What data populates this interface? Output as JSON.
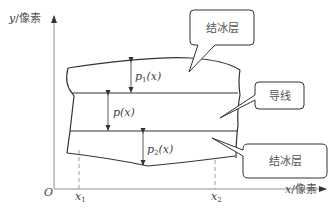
{
  "diagram": {
    "axes": {
      "y_label_var": "y",
      "y_label_unit": "/像素",
      "x_label_var": "x",
      "x_label_unit": "/像素",
      "origin": "O",
      "x1_var": "x",
      "x1_sub": "1",
      "x2_var": "x",
      "x2_sub": "2"
    },
    "measurements": {
      "p1_var": "p",
      "p1_sub": "1",
      "p1_arg": "(x)",
      "p_label": "p(x)",
      "p2_var": "p",
      "p2_sub": "2",
      "p2_arg": "(x)"
    },
    "callouts": [
      {
        "label": "结冰层"
      },
      {
        "label": "导线"
      },
      {
        "label": "结冰层"
      }
    ],
    "colors": {
      "line": "#333333",
      "axis": "#777777",
      "text": "#555555"
    }
  }
}
